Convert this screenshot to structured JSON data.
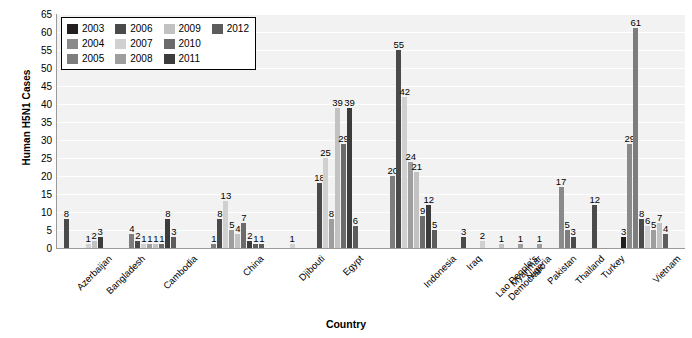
{
  "chart_data": {
    "type": "bar",
    "title": "",
    "xlabel": "Country",
    "ylabel": "Human H5N1 Cases",
    "ylim": [
      0,
      65
    ],
    "yticks": [
      0,
      5,
      10,
      15,
      20,
      25,
      30,
      35,
      40,
      45,
      50,
      55,
      60,
      65
    ],
    "grid": true,
    "legend_position": "top-left",
    "categories": [
      "Azerbaijan",
      "Bangladesh",
      "Cambodia",
      "China",
      "Djibouti",
      "Egypt",
      "Indonesia",
      "Iraq",
      "Lao People's Democratic",
      "Myanmar",
      "Nigeria",
      "Pakistan",
      "Thailand",
      "Turkey",
      "Vietnam"
    ],
    "series": [
      {
        "name": "2003",
        "color": "#231f20",
        "values": [
          null,
          null,
          null,
          null,
          null,
          null,
          null,
          null,
          null,
          null,
          null,
          null,
          null,
          null,
          3
        ]
      },
      {
        "name": "2004",
        "color": "#8a8a8a",
        "values": [
          null,
          null,
          null,
          null,
          null,
          null,
          null,
          null,
          null,
          null,
          null,
          null,
          17,
          null,
          29
        ]
      },
      {
        "name": "2005",
        "color": "#7d7d7d",
        "values": [
          null,
          null,
          4,
          1,
          null,
          null,
          20,
          null,
          null,
          null,
          null,
          null,
          5,
          null,
          61
        ]
      },
      {
        "name": "2006",
        "color": "#4a4a4a",
        "values": [
          8,
          null,
          2,
          8,
          null,
          18,
          55,
          3,
          null,
          null,
          null,
          null,
          3,
          12,
          8
        ]
      },
      {
        "name": "2007",
        "color": "#d0d0d0",
        "values": [
          null,
          1,
          1,
          13,
          1,
          25,
          42,
          null,
          2,
          null,
          null,
          null,
          null,
          null,
          6
        ]
      },
      {
        "name": "2008",
        "color": "#9e9e9e",
        "values": [
          null,
          null,
          1,
          5,
          null,
          8,
          24,
          null,
          null,
          null,
          1,
          1,
          null,
          null,
          5
        ]
      },
      {
        "name": "2009",
        "color": "#c2c2c2",
        "values": [
          null,
          2,
          1,
          4,
          null,
          39,
          21,
          null,
          null,
          1,
          null,
          null,
          null,
          null,
          7
        ]
      },
      {
        "name": "2010",
        "color": "#6b6b6b",
        "values": [
          null,
          null,
          1,
          7,
          null,
          29,
          9,
          null,
          null,
          null,
          null,
          null,
          null,
          null,
          null
        ]
      },
      {
        "name": "2011",
        "color": "#3c3c3c",
        "values": [
          null,
          3,
          8,
          2,
          null,
          39,
          12,
          null,
          null,
          null,
          null,
          null,
          null,
          null,
          null
        ]
      },
      {
        "name": "2012",
        "color": "#5c5c5c",
        "values": [
          null,
          null,
          3,
          1,
          null,
          6,
          5,
          null,
          null,
          null,
          null,
          null,
          null,
          null,
          4
        ]
      }
    ],
    "bar_labels_shown": true,
    "groups": [
      {
        "country": "Azerbaijan",
        "bars": [
          {
            "year": "2006",
            "value": 8
          }
        ]
      },
      {
        "country": "Bangladesh",
        "bars": [
          {
            "year": "2007",
            "value": 1
          },
          {
            "year": "2009",
            "value": 2
          },
          {
            "year": "2011",
            "value": 3
          }
        ]
      },
      {
        "country": "Cambodia",
        "bars": [
          {
            "year": "2005",
            "value": 4
          },
          {
            "year": "2006",
            "value": 2
          },
          {
            "year": "2007",
            "value": 1
          },
          {
            "year": "2008",
            "value": 1
          },
          {
            "year": "2009",
            "value": 1
          },
          {
            "year": "2010",
            "value": 1
          },
          {
            "year": "2011",
            "value": 8
          },
          {
            "year": "2012",
            "value": 3
          }
        ]
      },
      {
        "country": "China",
        "bars": [
          {
            "year": "2005",
            "value": 1
          },
          {
            "year": "2006",
            "value": 8
          },
          {
            "year": "2007",
            "value": 13
          },
          {
            "year": "2008",
            "value": 5
          },
          {
            "year": "2009",
            "value": 4
          },
          {
            "year": "2010",
            "value": 7
          },
          {
            "year": "2011",
            "value": 2
          },
          {
            "year": "2012",
            "value": 1
          },
          {
            "year": "2012b",
            "value": 1
          }
        ]
      },
      {
        "country": "Djibouti",
        "bars": [
          {
            "year": "2007",
            "value": 1
          }
        ]
      },
      {
        "country": "Egypt",
        "bars": [
          {
            "year": "2006",
            "value": 18
          },
          {
            "year": "2007",
            "value": 25
          },
          {
            "year": "2008",
            "value": 8
          },
          {
            "year": "2009",
            "value": 39
          },
          {
            "year": "2010",
            "value": 29
          },
          {
            "year": "2011",
            "value": 39
          },
          {
            "year": "2012",
            "value": 6
          }
        ]
      },
      {
        "country": "Indonesia",
        "bars": [
          {
            "year": "2005",
            "value": 20
          },
          {
            "year": "2006",
            "value": 55
          },
          {
            "year": "2007",
            "value": 42
          },
          {
            "year": "2008",
            "value": 24
          },
          {
            "year": "2009",
            "value": 21
          },
          {
            "year": "2010",
            "value": 9
          },
          {
            "year": "2011",
            "value": 12
          },
          {
            "year": "2012",
            "value": 5
          }
        ]
      },
      {
        "country": "Iraq",
        "bars": [
          {
            "year": "2006",
            "value": 3
          }
        ]
      },
      {
        "country": "Lao People's Democratic",
        "bars": [
          {
            "year": "2007",
            "value": 2
          }
        ]
      },
      {
        "country": "Myanmar",
        "bars": [
          {
            "year": "2009",
            "value": 1
          }
        ]
      },
      {
        "country": "Nigeria",
        "bars": [
          {
            "year": "2008",
            "value": 1
          }
        ]
      },
      {
        "country": "Pakistan",
        "bars": [
          {
            "year": "2008",
            "value": 1
          }
        ]
      },
      {
        "country": "Thailand",
        "bars": [
          {
            "year": "2004",
            "value": 17
          },
          {
            "year": "2005",
            "value": 5
          },
          {
            "year": "2006",
            "value": 3
          }
        ]
      },
      {
        "country": "Turkey",
        "bars": [
          {
            "year": "2006",
            "value": 12
          }
        ]
      },
      {
        "country": "Vietnam",
        "bars": [
          {
            "year": "2003",
            "value": 3
          },
          {
            "year": "2004",
            "value": 29
          },
          {
            "year": "2005",
            "value": 61
          },
          {
            "year": "2006",
            "value": 8
          },
          {
            "year": "2007",
            "value": 6
          },
          {
            "year": "2008",
            "value": 5
          },
          {
            "year": "2009",
            "value": 7
          },
          {
            "year": "2012",
            "value": 4
          }
        ]
      }
    ]
  },
  "legend": {
    "items": [
      {
        "label": "2003",
        "color": "#231f20"
      },
      {
        "label": "2004",
        "color": "#8a8a8a"
      },
      {
        "label": "2005",
        "color": "#7d7d7d"
      },
      {
        "label": "2006",
        "color": "#4a4a4a"
      },
      {
        "label": "2007",
        "color": "#d0d0d0"
      },
      {
        "label": "2008",
        "color": "#9e9e9e"
      },
      {
        "label": "2009",
        "color": "#c2c2c2"
      },
      {
        "label": "2010",
        "color": "#6b6b6b"
      },
      {
        "label": "2011",
        "color": "#3c3c3c"
      },
      {
        "label": "2012",
        "color": "#5c5c5c"
      }
    ]
  },
  "axes": {
    "y_title": "Human H5N1 Cases",
    "x_title": "Country"
  },
  "colors": {
    "plot_background": "#f2f2f2",
    "gridline": "#ffffff",
    "axis": "#9a9a9a",
    "text": "#000000"
  }
}
